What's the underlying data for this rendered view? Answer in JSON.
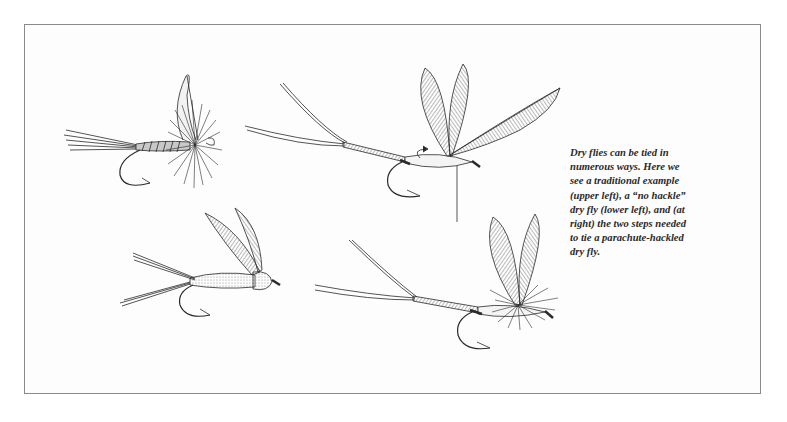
{
  "figure": {
    "caption_lines": [
      "Dry flies can be tied in",
      "numerous ways. Here we",
      "see a traditional example",
      "(upper left), a “no hackle”",
      "dry fly (lower left), and (at",
      "right) the two steps needed",
      "to tie a parachute-hackled",
      "dry fly."
    ],
    "panels": [
      {
        "name": "traditional-dry-fly",
        "position": "upper left"
      },
      {
        "name": "no-hackle-dry-fly",
        "position": "lower left"
      },
      {
        "name": "parachute-step-1",
        "position": "upper right"
      },
      {
        "name": "parachute-step-2",
        "position": "lower right"
      }
    ],
    "colors": {
      "ink": "#2a2a2a",
      "border": "#8a8a8a",
      "background": "#ffffff"
    }
  }
}
